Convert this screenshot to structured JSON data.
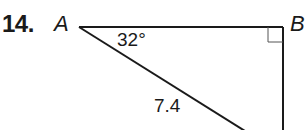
{
  "problem": {
    "number": "14.",
    "vertices": {
      "a": "A",
      "b": "B"
    },
    "angle_label": "32°",
    "side_label": "7.4",
    "right_angle_at": "B"
  }
}
